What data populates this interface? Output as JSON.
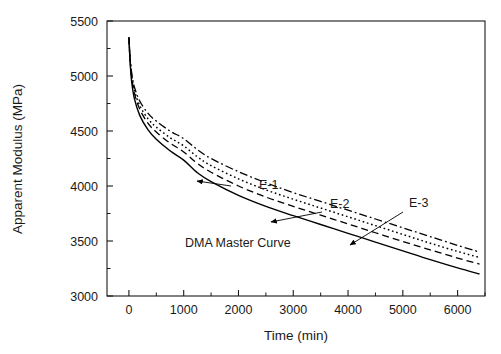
{
  "chart_data": {
    "type": "line",
    "title": "",
    "xlabel": "Time (min)",
    "ylabel": "Apparent Modulus (MPa)",
    "xlim": [
      -400,
      6500
    ],
    "ylim": [
      3000,
      5500
    ],
    "xticks": [
      0,
      1000,
      2000,
      3000,
      4000,
      5000,
      6000
    ],
    "xtick_labels": [
      "0",
      "1000",
      "2000",
      "3000",
      "4000",
      "5000",
      "6000"
    ],
    "yticks": [
      3000,
      3500,
      4000,
      4500,
      5000,
      5500
    ],
    "ytick_labels": [
      "3000",
      "3500",
      "4000",
      "4500",
      "5000",
      "5500"
    ],
    "x_minor_step": 500,
    "y_minor_step": 250,
    "grid": false,
    "legend": "none",
    "series": [
      {
        "name": "E-1",
        "style": "dash-dot",
        "x": [
          0,
          20,
          50,
          100,
          200,
          350,
          500,
          750,
          1000,
          1250,
          1500,
          2000,
          2500,
          3000,
          3500,
          4000,
          4500,
          5000,
          5500,
          6000,
          6400
        ],
        "y": [
          5350,
          5180,
          5030,
          4900,
          4770,
          4660,
          4590,
          4500,
          4430,
          4330,
          4250,
          4130,
          4030,
          3940,
          3860,
          3780,
          3700,
          3620,
          3540,
          3460,
          3400
        ]
      },
      {
        "name": "E-2",
        "style": "dotted",
        "x": [
          0,
          20,
          50,
          100,
          200,
          350,
          500,
          750,
          1000,
          1250,
          1500,
          2000,
          2500,
          3000,
          3500,
          4000,
          4500,
          5000,
          5500,
          6000,
          6400
        ],
        "y": [
          5350,
          5170,
          5010,
          4870,
          4730,
          4610,
          4535,
          4440,
          4365,
          4265,
          4185,
          4065,
          3965,
          3880,
          3800,
          3720,
          3640,
          3560,
          3480,
          3405,
          3350
        ]
      },
      {
        "name": "E-3",
        "style": "dashed",
        "x": [
          0,
          20,
          50,
          100,
          200,
          350,
          500,
          750,
          1000,
          1250,
          1500,
          2000,
          2500,
          3000,
          3500,
          4000,
          4500,
          5000,
          5500,
          6000,
          6400
        ],
        "y": [
          5350,
          5160,
          4990,
          4845,
          4695,
          4570,
          4490,
          4390,
          4310,
          4205,
          4125,
          4000,
          3900,
          3815,
          3735,
          3655,
          3575,
          3495,
          3420,
          3345,
          3290
        ]
      },
      {
        "name": "DMA Master Curve",
        "style": "solid",
        "x": [
          0,
          20,
          50,
          100,
          200,
          350,
          500,
          750,
          1000,
          1250,
          1500,
          2000,
          2500,
          3000,
          3500,
          4000,
          4500,
          5000,
          5500,
          6000,
          6400
        ],
        "y": [
          5350,
          5140,
          4950,
          4795,
          4640,
          4510,
          4425,
          4320,
          4235,
          4120,
          4040,
          3915,
          3815,
          3730,
          3650,
          3570,
          3490,
          3410,
          3330,
          3255,
          3200
        ]
      }
    ],
    "annotations": [
      {
        "text": "E-1",
        "label_x": 259,
        "label_y": 189,
        "arrow_from_x": 231,
        "arrow_from_y": 186,
        "arrow_to_x": 197,
        "arrow_to_y": 181
      },
      {
        "text": "E-2",
        "label_x": 330,
        "label_y": 208,
        "arrow_from_x": 322,
        "arrow_from_y": 212,
        "arrow_to_x": 271,
        "arrow_to_y": 222
      },
      {
        "text": "E-3",
        "label_x": 409,
        "label_y": 207,
        "arrow_from_x": 403,
        "arrow_from_y": 212,
        "arrow_to_x": 350,
        "arrow_to_y": 245
      },
      {
        "text": "DMA Master Curve",
        "label_x": 185,
        "label_y": 247,
        "arrow_from_x": null,
        "arrow_from_y": null,
        "arrow_to_x": null,
        "arrow_to_y": null
      }
    ]
  },
  "axes": {
    "x_title": "Time (min)",
    "y_title": "Apparent Modulus (MPa)"
  }
}
